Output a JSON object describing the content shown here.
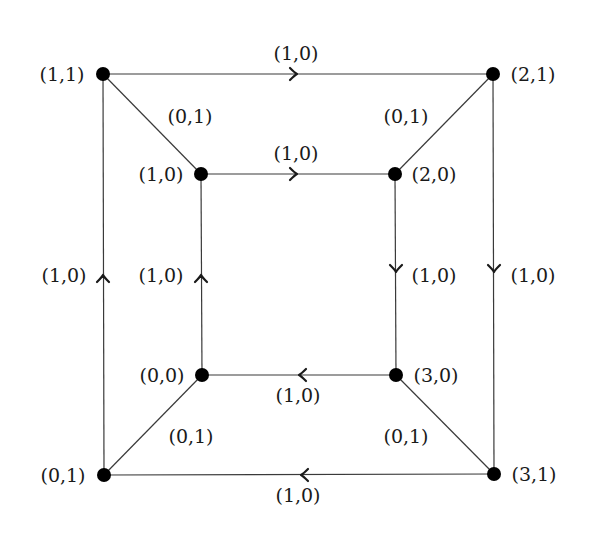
{
  "diagram": {
    "title": "",
    "nodes": [
      {
        "id": "n11",
        "label": "(1,1)",
        "x": 103,
        "y": 74,
        "label_x": 62,
        "label_y": 81,
        "anchor": "middle"
      },
      {
        "id": "n21",
        "label": "(2,1)",
        "x": 493,
        "y": 74,
        "label_x": 533,
        "label_y": 81,
        "anchor": "middle"
      },
      {
        "id": "n10",
        "label": "(1,0)",
        "x": 201,
        "y": 174,
        "label_x": 161,
        "label_y": 181,
        "anchor": "middle"
      },
      {
        "id": "n20",
        "label": "(2,0)",
        "x": 395,
        "y": 174,
        "label_x": 434,
        "label_y": 181,
        "anchor": "middle"
      },
      {
        "id": "n00",
        "label": "(0,0)",
        "x": 202,
        "y": 375,
        "label_x": 162,
        "label_y": 382,
        "anchor": "middle"
      },
      {
        "id": "n30",
        "label": "(3,0)",
        "x": 396,
        "y": 375,
        "label_x": 436,
        "label_y": 382,
        "anchor": "middle"
      },
      {
        "id": "n01",
        "label": "(0,1)",
        "x": 104,
        "y": 475,
        "label_x": 63,
        "label_y": 482,
        "anchor": "middle"
      },
      {
        "id": "n31",
        "label": "(3,1)",
        "x": 494,
        "y": 474,
        "label_x": 534,
        "label_y": 481,
        "anchor": "middle"
      }
    ],
    "edges": [
      {
        "id": "e-top-outer",
        "from": "n11",
        "to": "n21",
        "label": "(1,0)",
        "arrow": "right",
        "arrow_x": 296,
        "arrow_y": 74,
        "label_x": 296,
        "label_y": 60
      },
      {
        "id": "e-top-inner",
        "from": "n10",
        "to": "n20",
        "label": "(1,0)",
        "arrow": "right",
        "arrow_x": 296,
        "arrow_y": 174,
        "label_x": 296,
        "label_y": 160
      },
      {
        "id": "e-bottom-inner",
        "from": "n30",
        "to": "n00",
        "label": "(1,0)",
        "arrow": "left",
        "arrow_x": 300,
        "arrow_y": 375,
        "label_x": 298,
        "label_y": 402
      },
      {
        "id": "e-bottom-outer",
        "from": "n31",
        "to": "n01",
        "label": "(1,0)",
        "arrow": "left",
        "arrow_x": 302,
        "arrow_y": 475,
        "label_x": 298,
        "label_y": 502
      },
      {
        "id": "e-left-outer",
        "from": "n01",
        "to": "n11",
        "label": "(1,0)",
        "arrow": "up",
        "arrow_x": 103,
        "arrow_y": 276,
        "label_x": 64,
        "label_y": 282
      },
      {
        "id": "e-left-inner",
        "from": "n00",
        "to": "n10",
        "label": "(1,0)",
        "arrow": "up",
        "arrow_x": 201,
        "arrow_y": 276,
        "label_x": 161,
        "label_y": 282
      },
      {
        "id": "e-right-inner",
        "from": "n20",
        "to": "n30",
        "label": "(1,0)",
        "arrow": "down",
        "arrow_x": 396,
        "arrow_y": 271,
        "label_x": 434,
        "label_y": 282
      },
      {
        "id": "e-right-outer",
        "from": "n21",
        "to": "n31",
        "label": "(1,0)",
        "arrow": "down",
        "arrow_x": 494,
        "arrow_y": 271,
        "label_x": 533,
        "label_y": 282
      },
      {
        "id": "e-diag-tl",
        "from": "n11",
        "to": "n10",
        "label": "(0,1)",
        "arrow": "none",
        "label_x": 190,
        "label_y": 123
      },
      {
        "id": "e-diag-tr",
        "from": "n20",
        "to": "n21",
        "label": "(0,1)",
        "arrow": "none",
        "label_x": 406,
        "label_y": 123
      },
      {
        "id": "e-diag-bl",
        "from": "n01",
        "to": "n00",
        "label": "(0,1)",
        "arrow": "none",
        "label_x": 191,
        "label_y": 443
      },
      {
        "id": "e-diag-br",
        "from": "n30",
        "to": "n31",
        "label": "(0,1)",
        "arrow": "none",
        "label_x": 406,
        "label_y": 443
      }
    ],
    "colors": {
      "line": "#3a3a3a",
      "node": "#000000",
      "text": "#1a1a1a",
      "background": "#ffffff"
    }
  }
}
